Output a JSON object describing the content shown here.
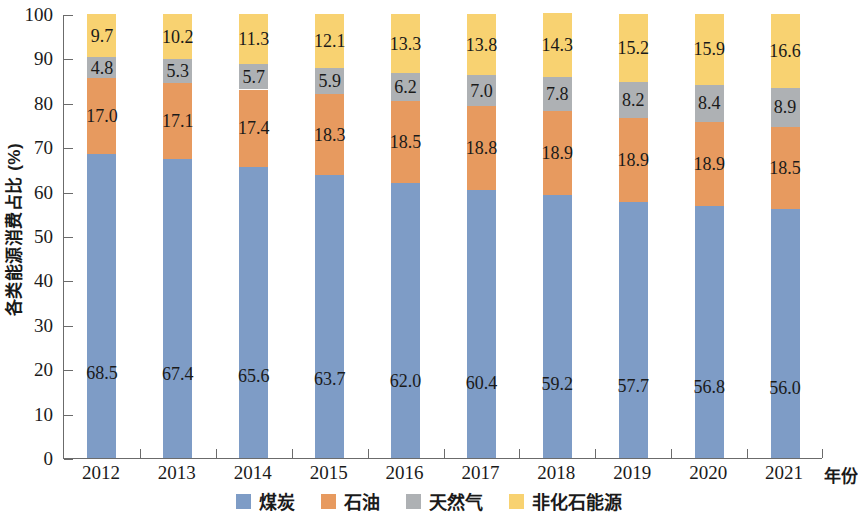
{
  "chart_data": {
    "type": "bar",
    "stacked": true,
    "title": "",
    "xlabel": "年份",
    "ylabel": "各类能源消费占比 (%)",
    "categories": [
      "2012",
      "2013",
      "2014",
      "2015",
      "2016",
      "2017",
      "2018",
      "2019",
      "2020",
      "2021"
    ],
    "ylim": [
      0,
      100
    ],
    "yticks": [
      0,
      10,
      20,
      30,
      40,
      50,
      60,
      70,
      80,
      90,
      100
    ],
    "ytick_labels": [
      "0",
      "10",
      "20",
      "30",
      "40",
      "50",
      "60",
      "70",
      "80",
      "90",
      "100"
    ],
    "grid": false,
    "legend_position": "bottom",
    "series": [
      {
        "name": "煤炭",
        "color": "#7e9cc6",
        "values": [
          68.5,
          67.4,
          65.6,
          63.7,
          62.0,
          60.4,
          59.2,
          57.7,
          56.8,
          56.0
        ]
      },
      {
        "name": "石油",
        "color": "#e79a5f",
        "values": [
          17.0,
          17.1,
          17.4,
          18.3,
          18.5,
          18.8,
          18.9,
          18.9,
          18.9,
          18.5
        ]
      },
      {
        "name": "天然气",
        "color": "#aeb1b4",
        "values": [
          4.8,
          5.3,
          5.7,
          5.9,
          6.2,
          7.0,
          7.8,
          8.2,
          8.4,
          8.9
        ]
      },
      {
        "name": "非化石能源",
        "color": "#f8d271",
        "values": [
          9.7,
          10.2,
          11.3,
          12.1,
          13.3,
          13.8,
          14.3,
          15.2,
          15.9,
          16.6
        ]
      }
    ]
  },
  "axis": {
    "frame_color": "#6b6b6b"
  }
}
